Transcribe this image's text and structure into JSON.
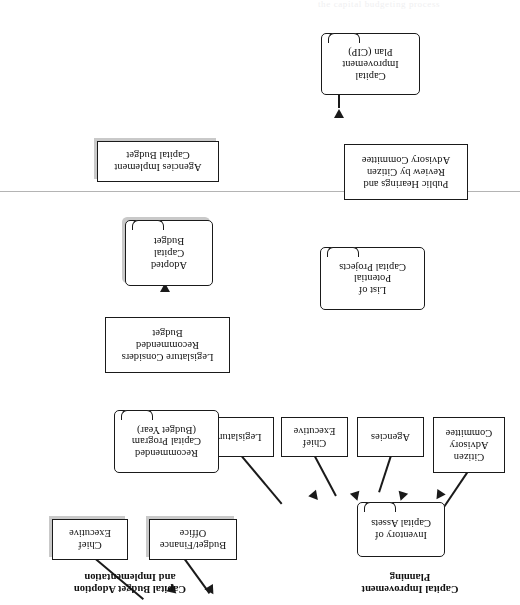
{
  "figure": {
    "divider_rule_visible": true,
    "orientation_note": "180-degree-rotated-scan"
  },
  "sections": {
    "planning": {
      "caption": "Capital Improvement\nPlanning"
    },
    "adoption": {
      "caption": "Capital Budget Adoption\nand Implementation"
    }
  },
  "nodes": {
    "inventory_of_capital_assets": "Inventory of\nCapital Assets",
    "legislature": "Legislature",
    "chief_executive_planning": "Chief\nExecutive",
    "agencies": "Agencies",
    "citizen_advisory_committee": "Citizen\nAdvisory\nCommittee",
    "list_of_potential_capital_projects": "List of\nPotential\nCapital Projects",
    "public_hearings_and_review": "Public Hearings and\nReview by Citizen\nAdvisory Committee",
    "capital_improvement_plan": "Capital\nImprovement\nPlan (CIP)",
    "chief_executive_adoption": "Chief\nExecutive",
    "budget_finance_office": "Budget/Finance\nOffice",
    "recommended_capital_program": "Recommended\nCapital Program\n(Budget Year)",
    "legislature_considers_budget": "Legislature Considers\nRecommended\nBudget",
    "adopted_capital_budget": "Adopted\nCapital\nBudget",
    "agencies_implement_capital_budget": "Agencies Implement\nCapital Budget"
  },
  "colors": {
    "stroke": "#1a1a1a",
    "shadow": "#c9c9c9",
    "divider": "#b4b4b4",
    "background": "#ffffff"
  },
  "cropped_header_text": "the capital budgeting process"
}
